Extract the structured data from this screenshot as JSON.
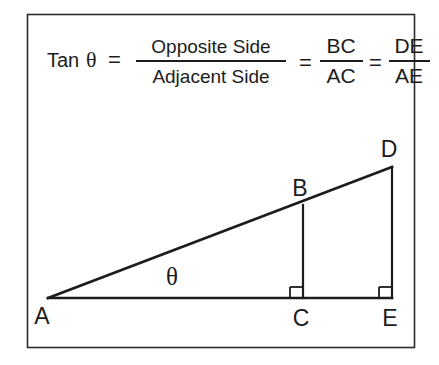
{
  "figure": {
    "background_color": "#ffffff",
    "line_color": "#1c1c1c",
    "border_color": "#2b2b2b"
  },
  "formula": {
    "function_name": "Tan",
    "angle_symbol": "θ",
    "equals_1": "=",
    "fraction_1": {
      "numerator": "Opposite Side",
      "denominator": "Adjacent Side"
    },
    "equals_2": "=",
    "fraction_2": {
      "numerator": "BC",
      "denominator": "AC"
    },
    "equals_3": "=",
    "fraction_3": {
      "numerator": "DE",
      "denominator": "AE"
    }
  },
  "diagram": {
    "angle_label": "θ",
    "vertices": [
      {
        "id": "A",
        "label": "A",
        "x": 48,
        "y": 298,
        "label_x": 42,
        "label_y": 322
      },
      {
        "id": "B",
        "label": "B",
        "x": 303,
        "y": 205,
        "label_x": 296,
        "label_y": 193
      },
      {
        "id": "C",
        "label": "C",
        "x": 303,
        "y": 298,
        "label_x": 296,
        "label_y": 323
      },
      {
        "id": "D",
        "label": "D",
        "x": 392,
        "y": 167,
        "label_x": 382,
        "label_y": 154
      },
      {
        "id": "E",
        "label": "E",
        "x": 392,
        "y": 298,
        "label_x": 384,
        "label_y": 323
      }
    ],
    "segments": [
      {
        "name": "hypotenuse-AD",
        "from": "A",
        "to": "D"
      },
      {
        "name": "base-AE",
        "from": "A",
        "to": "E"
      },
      {
        "name": "opposite-BC",
        "from": "B",
        "to": "C"
      },
      {
        "name": "opposite-DE",
        "from": "D",
        "to": "E"
      }
    ],
    "right_angles": [
      {
        "name": "right-angle-at-C",
        "vertex": "C"
      },
      {
        "name": "right-angle-at-E",
        "vertex": "E"
      }
    ]
  }
}
